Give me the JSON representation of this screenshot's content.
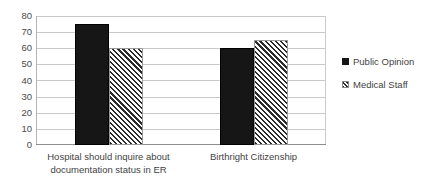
{
  "chart_data": {
    "type": "bar",
    "title": "",
    "xlabel": "",
    "ylabel": "",
    "ylim": [
      0,
      80
    ],
    "ytick_step": 10,
    "yticks": [
      "80",
      "70",
      "60",
      "50",
      "40",
      "30",
      "20",
      "10",
      "0"
    ],
    "grid": true,
    "legend_position": "right",
    "categories": [
      "Hospital should inquire about documentation status in ER",
      "Birthright Citizenship"
    ],
    "series": [
      {
        "name": "Public Opinion",
        "style": "solid-black",
        "values": [
          75,
          60
        ]
      },
      {
        "name": "Medical Staff",
        "style": "diagonal-hatch",
        "values": [
          60,
          65
        ]
      }
    ]
  },
  "colors": {
    "series_public_opinion": "#161616",
    "series_medical_staff_hatch": "#2b2b2b",
    "gridline": "#c9c9c9",
    "axis": "#8e8e8e",
    "text": "#3f3f3f",
    "background": "#ffffff"
  }
}
